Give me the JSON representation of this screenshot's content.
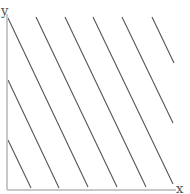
{
  "diagram": {
    "title": "",
    "axes": {
      "x_label": "x",
      "y_label": "y",
      "axis_color": "#c8c8c8",
      "origin": [
        7,
        190
      ],
      "x_end": [
        176,
        190
      ],
      "y_end": [
        7,
        14
      ]
    },
    "line_color": "#555555",
    "lines": [
      {
        "x1": 8,
        "y1": 140,
        "x2": 31,
        "y2": 188
      },
      {
        "x1": 8,
        "y1": 80,
        "x2": 59,
        "y2": 188
      },
      {
        "x1": 8,
        "y1": 18,
        "x2": 88,
        "y2": 187
      },
      {
        "x1": 36,
        "y1": 17,
        "x2": 117,
        "y2": 187
      },
      {
        "x1": 65,
        "y1": 17,
        "x2": 146,
        "y2": 187
      },
      {
        "x1": 93,
        "y1": 17,
        "x2": 173,
        "y2": 184
      },
      {
        "x1": 122,
        "y1": 17,
        "x2": 173,
        "y2": 123
      },
      {
        "x1": 152,
        "y1": 17,
        "x2": 174,
        "y2": 63
      }
    ]
  }
}
